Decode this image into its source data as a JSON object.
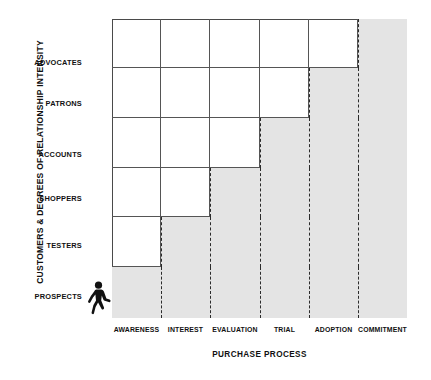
{
  "chart_data": {
    "type": "bar",
    "title": "",
    "xlabel": "PURCHASE PROCESS",
    "ylabel": "CUSTOMERS & DEGREES OF RELATIONSHIP INTENSITY",
    "categories": [
      "AWARENESS",
      "INTEREST",
      "EVALUATION",
      "TRIAL",
      "ADOPTION",
      "COMMITMENT"
    ],
    "row_categories": [
      "PROSPECTS",
      "TESTERS",
      "SHOPPERS",
      "ACCOUNTS",
      "PATRONS",
      "ADVOCATES"
    ],
    "series": [
      {
        "name": "White staircase extent (columns filled white, counted from left)",
        "categories": [
          "ADVOCATES",
          "PATRONS",
          "ACCOUNTS",
          "SHOPPERS",
          "TESTERS",
          "PROSPECTS"
        ],
        "values": [
          5,
          4,
          3,
          2,
          1,
          0
        ]
      }
    ],
    "grid": false,
    "legend": "none",
    "annotations": [
      "walking-person pictogram at lower-left of plot, facing right"
    ],
    "colors": {
      "shade": "#e4e4e4",
      "line": "#555555",
      "border": "#4a4a4a",
      "dash": "#2b2b2b",
      "text": "#111111",
      "background": "#ffffff"
    }
  },
  "axes": {
    "y_title": "CUSTOMERS & DEGREES OF RELATIONSHIP INTENSITY",
    "x_title": "PURCHASE PROCESS",
    "row_labels": [
      {
        "label": "ADVOCATES",
        "top": 57
      },
      {
        "label": "PATRONS",
        "top": 98
      },
      {
        "label": "ACCOUNTS",
        "top": 149
      },
      {
        "label": "SHOPPERS",
        "top": 193
      },
      {
        "label": "TESTERS",
        "top": 240
      },
      {
        "label": "PROSPECTS",
        "top": 291
      }
    ],
    "column_labels": [
      {
        "label": "AWARENESS",
        "left": 0,
        "width": 49
      },
      {
        "label": "INTEREST",
        "left": 49,
        "width": 49
      },
      {
        "label": "EVALUATION",
        "left": 98,
        "width": 50
      },
      {
        "label": "TRIAL",
        "left": 148,
        "width": 49
      },
      {
        "label": "ADOPTION",
        "left": 197,
        "width": 49
      },
      {
        "label": "COMMITMENT",
        "left": 246,
        "width": 49
      }
    ]
  },
  "plot_geometry": {
    "col_edges": [
      0,
      49,
      98,
      148,
      197,
      246,
      295
    ],
    "row_edges": [
      0,
      49,
      99,
      149,
      198,
      248,
      299
    ],
    "dash_lines_x": [
      49,
      98,
      148,
      197,
      246
    ],
    "step_rows": [
      {
        "row": "ADVOCATES",
        "row_index": 0,
        "white_cols": 5
      },
      {
        "row": "PATRONS",
        "row_index": 1,
        "white_cols": 4
      },
      {
        "row": "ACCOUNTS",
        "row_index": 2,
        "white_cols": 3
      },
      {
        "row": "SHOPPERS",
        "row_index": 3,
        "white_cols": 2
      },
      {
        "row": "TESTERS",
        "row_index": 4,
        "white_cols": 1
      },
      {
        "row": "PROSPECTS",
        "row_index": 5,
        "white_cols": 0
      }
    ]
  }
}
